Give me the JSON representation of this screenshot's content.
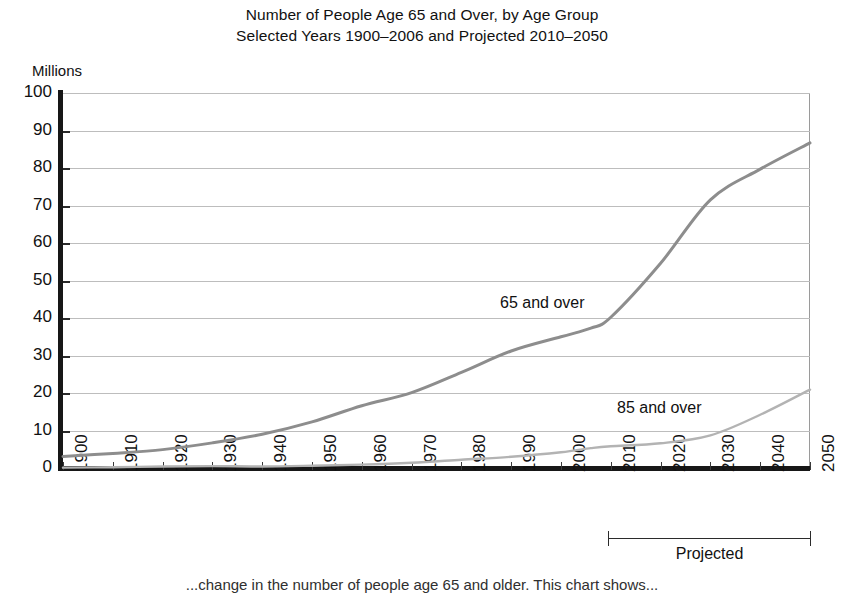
{
  "title": {
    "line1": "Number of People Age 65 and Over, by Age Group",
    "line2": "Selected Years 1900–2006 and Projected 2010–2050"
  },
  "axis": {
    "y_units_label": "Millions",
    "y_ticks": [
      "0",
      "10",
      "20",
      "30",
      "40",
      "50",
      "60",
      "70",
      "80",
      "90",
      "100"
    ],
    "x_ticks": [
      "1900",
      "1910",
      "1920",
      "1930",
      "1940",
      "1950",
      "1960",
      "1970",
      "1980",
      "1990",
      "2000",
      "2010",
      "2020",
      "2030",
      "2040",
      "2050"
    ]
  },
  "annotations": {
    "series_label_65": "65 and over",
    "series_label_85": "85 and over",
    "projected_label": "Projected",
    "projected_range_start": "2010",
    "projected_range_end": "2050"
  },
  "bottom_caption": "...change in the number of people age 65 and older. This chart shows...",
  "colors": {
    "line_65": "#8d8d8d",
    "line_85": "#b3b3b3",
    "axis": "#171717",
    "gridline": "#bdbdbd",
    "text": "#111111",
    "background": "#ffffff"
  },
  "chart_data": {
    "type": "line",
    "title": "Number of People Age 65 and Over, by Age Group",
    "subtitle": "Selected Years 1900–2006 and Projected 2010–2050",
    "xlabel": "",
    "ylabel": "Millions",
    "ylim": [
      0,
      100
    ],
    "xlim": [
      1900,
      2050
    ],
    "ytick_step": 10,
    "xtick_step": 10,
    "grid": "horizontal",
    "legend": "inline-annotations",
    "projected_from": 2010,
    "x": [
      1900,
      1910,
      1920,
      1930,
      1940,
      1950,
      1960,
      1970,
      1980,
      1990,
      2000,
      2006,
      2010,
      2020,
      2030,
      2040,
      2050
    ],
    "series": [
      {
        "name": "65 and over",
        "values": [
          3.1,
          3.9,
          4.9,
          6.7,
          9.0,
          12.3,
          16.6,
          20.1,
          25.5,
          31.2,
          35.0,
          37.3,
          40.2,
          54.6,
          71.5,
          79.7,
          86.7
        ]
      },
      {
        "name": "85 and over",
        "values": [
          0.1,
          0.2,
          0.4,
          0.5,
          0.4,
          0.6,
          0.9,
          1.4,
          2.2,
          3.0,
          4.2,
          5.3,
          5.8,
          6.6,
          8.7,
          14.2,
          20.9
        ]
      }
    ]
  }
}
